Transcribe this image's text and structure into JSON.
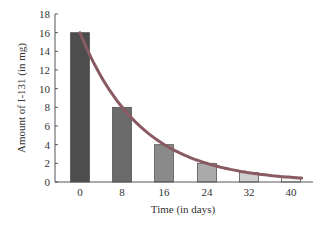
{
  "chart_data": {
    "type": "bar",
    "title": "",
    "xlabel": "Time (in days)",
    "ylabel": "Amount of I-131 (in mg)",
    "categories": [
      "0",
      "8",
      "16",
      "24",
      "32",
      "40"
    ],
    "values": [
      16,
      8,
      4,
      2,
      1,
      0.5
    ],
    "ylim": [
      0,
      18
    ],
    "yticks": [
      0,
      2,
      4,
      6,
      8,
      10,
      12,
      14,
      16,
      18
    ],
    "grid": false,
    "legend": null,
    "overlay": {
      "type": "line",
      "name": "exponential decay curve",
      "description": "smooth curve y = 16 * (1/2)^(t/8)",
      "color": "#8a5a62"
    },
    "bar_colors": [
      "#4d4d4d",
      "#6b6b6b",
      "#8a8a8a",
      "#ababab",
      "#cfcfcf",
      "#f4f4f4"
    ]
  }
}
